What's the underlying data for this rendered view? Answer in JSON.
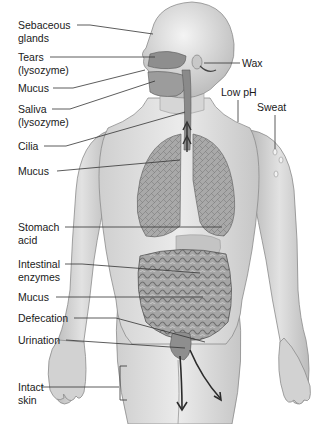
{
  "diagram": {
    "labels_left": [
      {
        "id": "sebaceous",
        "lines": [
          "Sebaceous",
          "glands"
        ]
      },
      {
        "id": "tears",
        "lines": [
          "Tears",
          "(lysozyme)"
        ]
      },
      {
        "id": "mucus-nose",
        "lines": [
          "Mucus"
        ]
      },
      {
        "id": "saliva",
        "lines": [
          "Saliva",
          "(lysozyme)"
        ]
      },
      {
        "id": "cilia",
        "lines": [
          "Cilia"
        ]
      },
      {
        "id": "mucus-lung",
        "lines": [
          "Mucus"
        ]
      },
      {
        "id": "stomach",
        "lines": [
          "Stomach",
          "acid"
        ]
      },
      {
        "id": "intestinal",
        "lines": [
          "Intestinal",
          "enzymes"
        ]
      },
      {
        "id": "mucus-gut",
        "lines": [
          "Mucus"
        ]
      },
      {
        "id": "defecation",
        "lines": [
          "Defecation"
        ]
      },
      {
        "id": "urination",
        "lines": [
          "Urination"
        ]
      },
      {
        "id": "skin",
        "lines": [
          "Intact",
          "skin"
        ]
      }
    ],
    "labels_right": [
      {
        "id": "wax",
        "lines": [
          "Wax"
        ]
      },
      {
        "id": "lowph",
        "lines": [
          "Low pH"
        ]
      },
      {
        "id": "sweat",
        "lines": [
          "Sweat"
        ]
      }
    ],
    "colors": {
      "background": "#ffffff",
      "skin_light": "#e4e4e4",
      "skin_mid": "#bdbdbd",
      "skin_dark": "#8a8a8a",
      "organ": "#9a9a9a",
      "leader_line": "#333333",
      "text": "#1a1a1a"
    }
  }
}
